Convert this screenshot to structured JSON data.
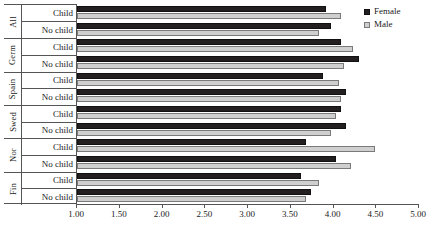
{
  "chart_data": {
    "type": "bar",
    "title": "",
    "subtitle": "",
    "xlabel": "",
    "ylabel": "",
    "orientation": "horizontal",
    "xlim": [
      1.0,
      5.0
    ],
    "xticks": [
      "1.00",
      "1.50",
      "2.00",
      "2.50",
      "3.00",
      "3.50",
      "4.00",
      "4.50",
      "5.00"
    ],
    "xtick_values": [
      1.0,
      1.5,
      2.0,
      2.5,
      3.0,
      3.5,
      4.0,
      4.5,
      5.0
    ],
    "grid": false,
    "legend_position": "top-right",
    "legend": [
      {
        "name": "Female",
        "color": "#231f20"
      },
      {
        "name": "Male",
        "color": "#cfcfcf"
      }
    ],
    "series": [
      {
        "name": "Female",
        "color": "#231f20"
      },
      {
        "name": "Male",
        "color": "#cfcfcf"
      }
    ],
    "row_labels": [
      "Child",
      "No child"
    ],
    "groups": [
      {
        "label": "All",
        "rows": [
          {
            "label": "Child",
            "Female": 3.91,
            "Male": 4.09
          },
          {
            "label": "No child",
            "Female": 3.97,
            "Male": 3.83
          }
        ]
      },
      {
        "label": "Germ",
        "rows": [
          {
            "label": "Child",
            "Female": 4.09,
            "Male": 4.23
          },
          {
            "label": "No child",
            "Female": 4.3,
            "Male": 4.12
          }
        ]
      },
      {
        "label": "Spain",
        "rows": [
          {
            "label": "Child",
            "Female": 3.88,
            "Male": 4.07
          },
          {
            "label": "No child",
            "Female": 4.15,
            "Male": 4.09
          }
        ]
      },
      {
        "label": "Swed",
        "rows": [
          {
            "label": "Child",
            "Female": 4.09,
            "Male": 4.03
          },
          {
            "label": "No child",
            "Female": 4.15,
            "Male": 3.97
          }
        ]
      },
      {
        "label": "Nor",
        "rows": [
          {
            "label": "Child",
            "Female": 3.68,
            "Male": 4.49
          },
          {
            "label": "No child",
            "Female": 4.03,
            "Male": 4.2
          }
        ]
      },
      {
        "label": "Fin",
        "rows": [
          {
            "label": "Child",
            "Female": 3.62,
            "Male": 3.83
          },
          {
            "label": "No child",
            "Female": 3.74,
            "Male": 3.68
          }
        ]
      }
    ]
  }
}
